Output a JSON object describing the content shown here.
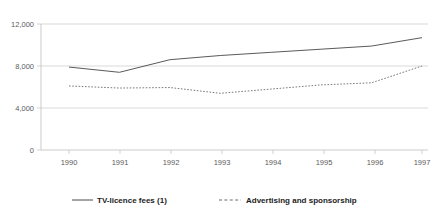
{
  "chart_data": {
    "type": "line",
    "title": "",
    "subtitle": "",
    "xlabel": "",
    "ylabel": "",
    "categories": [
      "1990",
      "1991",
      "1992",
      "1993",
      "1994",
      "1995",
      "1996",
      "1997"
    ],
    "x": [
      1990,
      1991,
      1992,
      1993,
      1994,
      1995,
      1996,
      1997
    ],
    "series": [
      {
        "name": "TV-licence fees (1)",
        "style": "solid",
        "color": "#5a5a5a",
        "values": [
          7900,
          7400,
          8600,
          9000,
          9300,
          9600,
          9900,
          10700
        ]
      },
      {
        "name": "Advertising and sponsorship",
        "style": "dashed",
        "color": "#7a7a7a",
        "values": [
          6100,
          5900,
          5950,
          5400,
          5800,
          6200,
          6400,
          8000
        ]
      }
    ],
    "ylim": [
      0,
      12000
    ],
    "yticks": [
      0,
      4000,
      8000,
      12000
    ],
    "ytick_labels": [
      "0",
      "4,000",
      "8,000",
      "12,000"
    ],
    "xtick_labels": [
      "1990",
      "1991",
      "1992",
      "1993",
      "1994",
      "1995",
      "1996",
      "1997"
    ],
    "grid": true,
    "grid_axis": "y",
    "legend_position": "bottom",
    "legend": [
      {
        "label": "TV-licence fees (1)",
        "style": "solid"
      },
      {
        "label": "Advertising and sponsorship",
        "style": "dashed"
      }
    ]
  },
  "axis": {
    "y": {
      "t0": "12,000",
      "t1": "8,000",
      "t2": "4,000",
      "t3": "0"
    },
    "x": {
      "t0": "1990",
      "t1": "1991",
      "t2": "1992",
      "t3": "1993",
      "t4": "1994",
      "t5": "1995",
      "t6": "1996",
      "t7": "1997"
    }
  },
  "legend": {
    "item0_label": "TV-licence fees (1)",
    "item1_label": "Advertising and sponsorship"
  }
}
